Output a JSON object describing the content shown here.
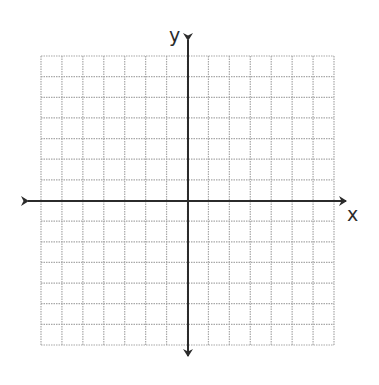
{
  "diagram": {
    "type": "coordinate-plane",
    "x_axis_label": "x",
    "y_axis_label": "y",
    "grid": {
      "columns": 14,
      "rows": 14,
      "left": 41,
      "top": 56,
      "right": 334,
      "bottom": 345,
      "line_color": "#a8a8a8",
      "line_style": "dotted"
    },
    "axes": {
      "origin_x": 188,
      "origin_y": 201,
      "x_arrow_left": 25,
      "x_arrow_right": 349,
      "y_arrow_top": 37,
      "y_arrow_bottom": 359,
      "color": "#2b2b2b",
      "width": 2
    }
  },
  "chart_data": {
    "type": "coordinate-plane",
    "title": "",
    "xlabel": "x",
    "ylabel": "y",
    "xlim": [
      -7,
      7
    ],
    "ylim": [
      -7,
      7
    ],
    "grid": true,
    "series": []
  }
}
